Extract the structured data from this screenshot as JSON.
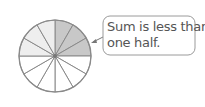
{
  "diagram": {
    "type": "fraction-circle",
    "total_slices": 12,
    "center": [
      55,
      56
    ],
    "radius": 36,
    "slices": [
      {
        "index": 0,
        "fill": "#c8c8c8",
        "group": "shaded"
      },
      {
        "index": 1,
        "fill": "#c8c8c8",
        "group": "shaded"
      },
      {
        "index": 2,
        "fill": "#c8c8c8",
        "group": "shaded"
      },
      {
        "index": 3,
        "fill": "#ffffff",
        "group": "empty"
      },
      {
        "index": 4,
        "fill": "#ffffff",
        "group": "empty"
      },
      {
        "index": 5,
        "fill": "#ffffff",
        "group": "empty"
      },
      {
        "index": 6,
        "fill": "#ffffff",
        "group": "empty"
      },
      {
        "index": 7,
        "fill": "#ffffff",
        "group": "empty"
      },
      {
        "index": 8,
        "fill": "#ffffff",
        "group": "empty"
      },
      {
        "index": 9,
        "fill": "#eeeeee",
        "group": "light"
      },
      {
        "index": 10,
        "fill": "#eeeeee",
        "group": "light"
      },
      {
        "index": 11,
        "fill": "#eeeeee",
        "group": "light"
      }
    ],
    "stroke_color": "#8a8a8a"
  },
  "callout": {
    "line1": "Sum is less than",
    "line2": "one half.",
    "border_color": "#9a9a9a",
    "text_color": "#555555"
  }
}
